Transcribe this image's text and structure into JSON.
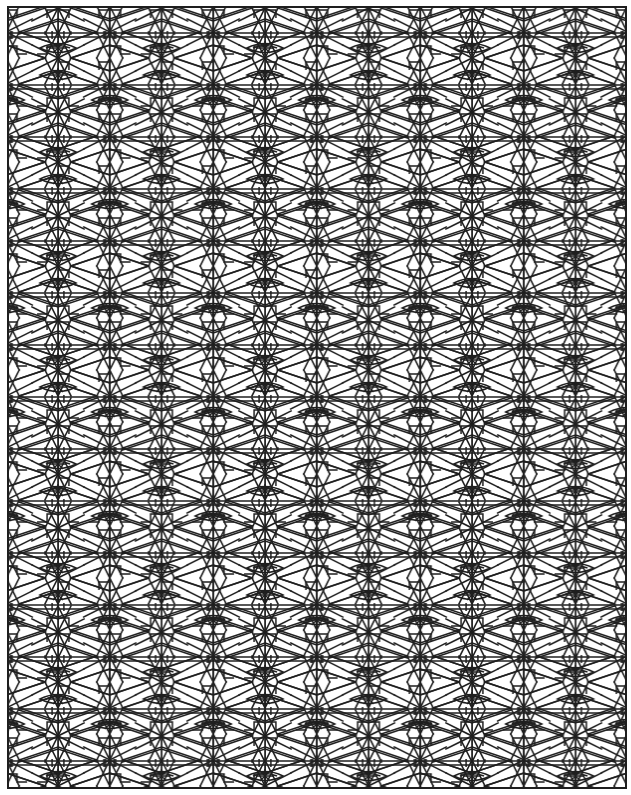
{
  "artwork": {
    "type": "geometric line-art pattern (coloring page)",
    "background_color": "#ffffff",
    "line_color": "#1e1e1e",
    "frame": {
      "x": 8,
      "y": 7,
      "width": 618,
      "height": 781
    },
    "tile": {
      "width": 103.5,
      "height": 104,
      "origin_x": 58,
      "origin_y": 58
    },
    "motifs": [
      "star-node",
      "eye-vesica",
      "double-band-line",
      "zigzag-diagonal",
      "tick-mark"
    ]
  }
}
